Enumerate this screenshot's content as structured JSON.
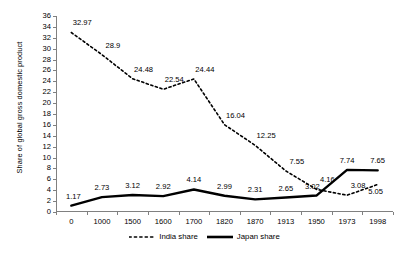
{
  "chart_data": {
    "type": "line",
    "title": "",
    "xlabel": "",
    "ylabel": "Share of global gross domestic product",
    "categories": [
      "0",
      "1000",
      "1500",
      "1600",
      "1700",
      "1820",
      "1870",
      "1913",
      "1950",
      "1973",
      "1998"
    ],
    "ylim": [
      0,
      36
    ],
    "ytick_step": 2,
    "yticks": [
      "0",
      "2",
      "4",
      "6",
      "8",
      "10",
      "12",
      "14",
      "16",
      "18",
      "20",
      "22",
      "24",
      "26",
      "28",
      "30",
      "32",
      "34",
      "36"
    ],
    "grid": false,
    "legend_position": "bottom",
    "series": [
      {
        "name": "India share",
        "style": "dashed",
        "color": "#000000",
        "values": [
          32.97,
          28.9,
          24.48,
          22.54,
          24.44,
          16.04,
          12.25,
          7.55,
          4.16,
          3.08,
          5.05
        ],
        "labels": [
          "32.97",
          "28.9",
          "24.48",
          "22.54",
          "24.44",
          "16.04",
          "12.25",
          "7.55",
          "4.16",
          "3.08",
          "5.05"
        ]
      },
      {
        "name": "Japan share",
        "style": "solid",
        "color": "#000000",
        "values": [
          1.17,
          2.73,
          3.12,
          2.92,
          4.14,
          2.99,
          2.31,
          2.65,
          3.02,
          7.74,
          7.65
        ],
        "labels": [
          "1.17",
          "2.73",
          "3.12",
          "2.92",
          "4.14",
          "2.99",
          "2.31",
          "2.65",
          "3.02",
          "7.74",
          "7.65"
        ]
      }
    ]
  },
  "legend": {
    "india_label": "India share",
    "japan_label": "Japan share"
  }
}
